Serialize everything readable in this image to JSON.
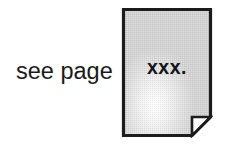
{
  "figure": {
    "background_color": "#ffffff",
    "width": 232,
    "height": 149
  },
  "caption": {
    "text": "see page",
    "color": "#1a1a1a"
  },
  "page_icon": {
    "name": "document-page-icon",
    "label": "xxx.",
    "label_color": "#141414",
    "fill_color": "#d2d2d2",
    "highlight_color": "#ffffff",
    "border_color": "#1c1c1c",
    "fold": {
      "name": "corner-fold",
      "position": "bottom-right",
      "fill_color": "#ffffff",
      "border_color": "#1c1c1c"
    }
  }
}
